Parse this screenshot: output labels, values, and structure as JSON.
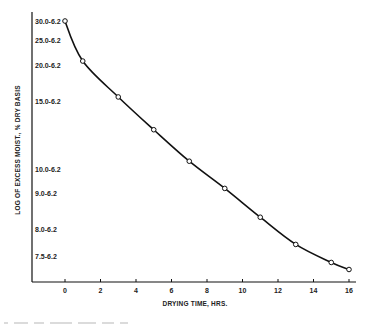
{
  "chart_data": {
    "type": "line",
    "title": "",
    "xlabel": "DRYING TIME, HRS.",
    "ylabel": "LOG OF EXCESS MOIST., % DRY BASIS",
    "x_ticks": [
      "0",
      "2",
      "4",
      "6",
      "8",
      "10",
      "12",
      "14",
      "16"
    ],
    "x_range": [
      -3.5,
      17
    ],
    "y_scale": "log",
    "y_ticks": [
      {
        "label": "30.0-6.2",
        "value": 23.8
      },
      {
        "label": "25.0-6.2",
        "value": 18.8
      },
      {
        "label": "20.0-6.2",
        "value": 13.8
      },
      {
        "label": "15.0-6.2",
        "value": 8.8
      },
      {
        "label": "10.0-6.2",
        "value": 3.8
      },
      {
        "label": "9.0-6.2",
        "value": 2.8
      },
      {
        "label": "8.0-6.2",
        "value": 1.8
      },
      {
        "label": "7.5-6.2",
        "value": 1.3
      }
    ],
    "series": [
      {
        "name": "excess moisture",
        "marker": "open-circle",
        "x": [
          0,
          1,
          3,
          5,
          7,
          9,
          11,
          13,
          15,
          16
        ],
        "values": [
          23.8,
          14.5,
          9.3,
          6.2,
          4.2,
          3.0,
          2.1,
          1.5,
          1.2,
          1.1
        ]
      }
    ],
    "grid": false,
    "legend": "none"
  }
}
